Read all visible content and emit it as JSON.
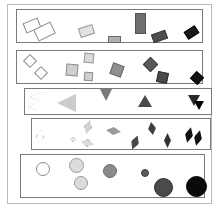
{
  "figure": {
    "title": "",
    "width": 219,
    "height": 210,
    "background": "#ffffff",
    "outer_frame": {
      "x": 7,
      "y": 4,
      "w": 205,
      "h": 200,
      "stroke": "#b8b8b8"
    }
  },
  "chart_data": {
    "type": "scatter",
    "title": "",
    "subtitle": "",
    "xlabel": "",
    "ylabel": "",
    "grid": false,
    "legend": null,
    "series": [
      {
        "name": "rectangles",
        "shape": "rectangle",
        "panel": {
          "x": 16,
          "y": 9,
          "w": 187,
          "h": 34,
          "stroke": "#7a7a7a"
        },
        "items": [
          {
            "x": 24,
            "y": 20,
            "w": 16,
            "h": 11,
            "rot": -22,
            "fill": "#ffffff",
            "stroke": "#8a8a8a"
          },
          {
            "x": 35,
            "y": 25,
            "w": 19,
            "h": 13,
            "rot": -26,
            "fill": "#ffffff",
            "stroke": "#8a8a8a"
          },
          {
            "x": 79,
            "y": 26,
            "w": 15,
            "h": 10,
            "rot": -18,
            "fill": "#e2e2e2",
            "stroke": "#9a9a9a"
          },
          {
            "x": 108,
            "y": 36,
            "w": 13,
            "h": 7,
            "rot": 0,
            "fill": "#b0b0b0",
            "stroke": "#6a6a6a"
          },
          {
            "x": 135,
            "y": 13,
            "w": 11,
            "h": 21,
            "rot": 0,
            "fill": "#6e6e6e",
            "stroke": "#555555"
          },
          {
            "x": 152,
            "y": 32,
            "w": 15,
            "h": 9,
            "rot": -20,
            "fill": "#4f4f4f",
            "stroke": "#3a3a3a"
          },
          {
            "x": 185,
            "y": 28,
            "w": 13,
            "h": 9,
            "rot": -33,
            "fill": "#1a1a1a",
            "stroke": "#000000"
          }
        ]
      },
      {
        "name": "squares",
        "shape": "square",
        "panel": {
          "x": 16,
          "y": 50,
          "w": 187,
          "h": 34,
          "stroke": "#7a7a7a"
        },
        "items": [
          {
            "x": 25,
            "y": 56,
            "w": 10,
            "h": 10,
            "rot": 45,
            "fill": "#ffffff",
            "stroke": "#8a8a8a"
          },
          {
            "x": 36,
            "y": 68,
            "w": 10,
            "h": 10,
            "rot": 45,
            "fill": "#ffffff",
            "stroke": "#8a8a8a"
          },
          {
            "x": 84,
            "y": 53,
            "w": 10,
            "h": 10,
            "rot": 6,
            "fill": "#d9d9d9",
            "stroke": "#999999"
          },
          {
            "x": 66,
            "y": 64,
            "w": 12,
            "h": 12,
            "rot": 5,
            "fill": "#cfcfcf",
            "stroke": "#8f8f8f"
          },
          {
            "x": 84,
            "y": 72,
            "w": 9,
            "h": 9,
            "rot": 3,
            "fill": "#cfcfcf",
            "stroke": "#8f8f8f"
          },
          {
            "x": 111,
            "y": 64,
            "w": 12,
            "h": 12,
            "rot": 20,
            "fill": "#8f8f8f",
            "stroke": "#6a6a6a"
          },
          {
            "x": 145,
            "y": 59,
            "w": 11,
            "h": 11,
            "rot": 45,
            "fill": "#585858",
            "stroke": "#3f3f3f"
          },
          {
            "x": 157,
            "y": 72,
            "w": 11,
            "h": 11,
            "rot": 12,
            "fill": "#4a4a4a",
            "stroke": "#333333"
          },
          {
            "x": 192,
            "y": 73,
            "w": 10,
            "h": 10,
            "rot": 42,
            "fill": "#111111",
            "stroke": "#000000"
          }
        ]
      },
      {
        "name": "triangles",
        "shape": "triangle",
        "panel": {
          "x": 24,
          "y": 88,
          "w": 188,
          "h": 27,
          "stroke": "#7a7a7a"
        },
        "items": [
          {
            "x": 30,
            "y": 92,
            "w": 11,
            "h": 11,
            "dir": "left",
            "fill": "#ffffff",
            "stroke": "#9a9a9a"
          },
          {
            "x": 28,
            "y": 103,
            "w": 8,
            "h": 8,
            "dir": "left",
            "fill": "#ffffff",
            "stroke": "#9a9a9a"
          },
          {
            "x": 57,
            "y": 94,
            "w": 19,
            "h": 18,
            "dir": "left",
            "fill": "#cccccc",
            "stroke": "#8a8a8a"
          },
          {
            "x": 100,
            "y": 89,
            "w": 12,
            "h": 12,
            "dir": "down",
            "fill": "#7a7a7a",
            "stroke": "#5a5a5a"
          },
          {
            "x": 138,
            "y": 95,
            "w": 14,
            "h": 12,
            "dir": "up",
            "fill": "#4a4a4a",
            "stroke": "#333333"
          },
          {
            "x": 188,
            "y": 95,
            "w": 12,
            "h": 11,
            "dir": "down",
            "fill": "#2a2a2a",
            "stroke": "#111111"
          },
          {
            "x": 194,
            "y": 101,
            "w": 10,
            "h": 9,
            "dir": "down",
            "fill": "#000000",
            "stroke": "#000000"
          }
        ]
      },
      {
        "name": "rhombi",
        "shape": "rhombus",
        "panel": {
          "x": 31,
          "y": 118,
          "w": 180,
          "h": 32,
          "stroke": "#7a7a7a"
        },
        "items": [
          {
            "x": 36,
            "y": 130,
            "w": 8,
            "h": 13,
            "rot": 12,
            "fill": "#ffffff",
            "stroke": "#8a8a8a"
          },
          {
            "x": 70,
            "y": 137,
            "w": 6,
            "h": 5,
            "rot": 10,
            "fill": "#e8e8e8",
            "stroke": "#a0a0a0"
          },
          {
            "x": 81,
            "y": 139,
            "w": 13,
            "h": 8,
            "rot": 12,
            "fill": "#dcdcdc",
            "stroke": "#8a8a8a"
          },
          {
            "x": 84,
            "y": 120,
            "w": 8,
            "h": 14,
            "rot": 14,
            "fill": "#d2d2d2",
            "stroke": "#888888"
          },
          {
            "x": 106,
            "y": 127,
            "w": 15,
            "h": 8,
            "rot": 8,
            "fill": "#9a9a9a",
            "stroke": "#6a6a6a"
          },
          {
            "x": 131,
            "y": 135,
            "w": 8,
            "h": 15,
            "rot": 22,
            "fill": "#4a4a4a",
            "stroke": "#333333"
          },
          {
            "x": 148,
            "y": 122,
            "w": 8,
            "h": 13,
            "rot": -8,
            "fill": "#3f3f3f",
            "stroke": "#2a2a2a"
          },
          {
            "x": 164,
            "y": 133,
            "w": 7,
            "h": 15,
            "rot": 0,
            "fill": "#333333",
            "stroke": "#1a1a1a"
          },
          {
            "x": 185,
            "y": 127,
            "w": 8,
            "h": 16,
            "rot": 14,
            "fill": "#111111",
            "stroke": "#000000"
          },
          {
            "x": 194,
            "y": 130,
            "w": 8,
            "h": 16,
            "rot": 14,
            "fill": "#111111",
            "stroke": "#000000"
          }
        ]
      },
      {
        "name": "circles",
        "shape": "circle",
        "panel": {
          "x": 20,
          "y": 154,
          "w": 185,
          "h": 44,
          "stroke": "#7a7a7a"
        },
        "items": [
          {
            "x": 36,
            "y": 162,
            "d": 14,
            "fill": "#ffffff",
            "stroke": "#8a8a8a"
          },
          {
            "x": 69,
            "y": 158,
            "d": 15,
            "fill": "#dcdcdc",
            "stroke": "#9a9a9a"
          },
          {
            "x": 74,
            "y": 176,
            "d": 14,
            "fill": "#dcdcdc",
            "stroke": "#9a9a9a"
          },
          {
            "x": 103,
            "y": 164,
            "d": 14,
            "fill": "#8a8a8a",
            "stroke": "#6a6a6a"
          },
          {
            "x": 141,
            "y": 169,
            "d": 8,
            "fill": "#5a5a5a",
            "stroke": "#3f3f3f"
          },
          {
            "x": 154,
            "y": 178,
            "d": 19,
            "fill": "#4a4a4a",
            "stroke": "#2a2a2a"
          },
          {
            "x": 186,
            "y": 176,
            "d": 21,
            "fill": "#0a0a0a",
            "stroke": "#000000"
          }
        ]
      }
    ]
  }
}
